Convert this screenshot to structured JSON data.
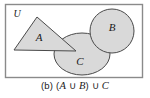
{
  "figure": {
    "type": "venn-diagram",
    "universe_label": "U",
    "background_color": "#ffffff",
    "shape_fill_color": "#d9d9d9",
    "shape_stroke_color": "#4a4a4a",
    "border_color": "#8a8a8a",
    "sets": [
      {
        "name": "A",
        "label": "A",
        "shape": "triangle",
        "points": "37,17 14,50 76,51"
      },
      {
        "name": "B",
        "label": "B",
        "shape": "circle",
        "cx": 112,
        "cy": 31,
        "r": 22
      },
      {
        "name": "C",
        "label": "C",
        "shape": "ellipse",
        "cx": 82,
        "cy": 54,
        "rx": 28,
        "ry": 21
      }
    ]
  },
  "caption": {
    "part_label": "(b)",
    "open_paren": "(",
    "set_a": "A",
    "union_1": "∪",
    "set_b": "B",
    "close_paren": ")",
    "union_2": "∪",
    "set_c": "C",
    "full_text": "(b) (A ∪ B) ∪ C"
  }
}
